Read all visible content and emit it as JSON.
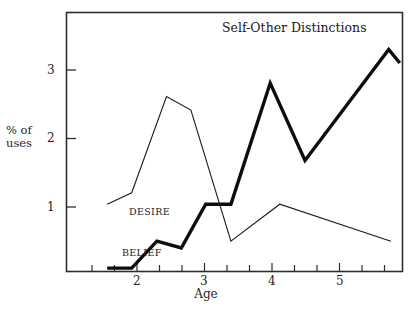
{
  "chart_data": {
    "type": "line",
    "title": "Self-Other Distinctions",
    "xlabel": "Age",
    "ylabel": "% of\nuses",
    "xlim": [
      1.45,
      6.0
    ],
    "ylim": [
      0,
      3.85
    ],
    "xticks": [
      2,
      3,
      4,
      5
    ],
    "xtick_labels": [
      "2",
      "3",
      "4",
      "5"
    ],
    "xminor_step": 0.3333,
    "yticks": [
      1,
      2,
      3
    ],
    "ytick_labels": [
      "1",
      "2",
      "3"
    ],
    "grid": false,
    "legend": "inline-labels",
    "series": [
      {
        "name": "DESIRE",
        "style": "thin",
        "color": "#1a1a1a",
        "line_width": 1.1,
        "x": [
          2.0,
          2.33,
          2.8,
          3.13,
          3.67,
          4.33,
          5.83
        ],
        "values": [
          1.0,
          1.17,
          2.6,
          2.4,
          0.45,
          1.0,
          0.45
        ]
      },
      {
        "name": "BELIEF",
        "style": "thick",
        "color": "#0d0d0d",
        "line_width": 3.4,
        "x": [
          2.0,
          2.33,
          2.67,
          3.0,
          3.33,
          3.67,
          4.2,
          4.67,
          5.8,
          5.95
        ],
        "values": [
          0.05,
          0.05,
          0.45,
          0.35,
          1.0,
          1.0,
          2.8,
          1.65,
          3.3,
          3.1
        ]
      }
    ],
    "annotations": [
      {
        "text": "DESIRE",
        "x": 1.96,
        "y": 0.93
      },
      {
        "text": "BELIEF",
        "x": 1.86,
        "y": 0.35
      }
    ]
  },
  "axes": {
    "ylabel_line1": "% of",
    "ylabel_line2": "uses",
    "xlabel": "Age"
  },
  "colors": {
    "background": "#ffffff",
    "frame": "#2e2e2e",
    "ink": "#1a1a1a"
  }
}
